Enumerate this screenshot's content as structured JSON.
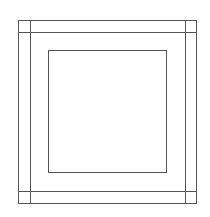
{
  "diagram": {
    "stroke_color": "#555555",
    "background": "#ffffff",
    "outer_square": {
      "x": 18,
      "y": 20,
      "width": 178,
      "height": 183
    },
    "inner_border": {
      "left_x": 30,
      "right_x": 185,
      "top_y": 32,
      "bottom_y": 191
    },
    "center_square": {
      "x": 48,
      "y": 50,
      "width": 118,
      "height": 122
    }
  }
}
